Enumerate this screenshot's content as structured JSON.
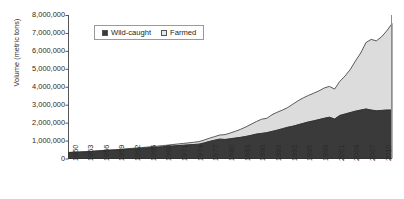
{
  "chart_data": {
    "type": "area",
    "title": "",
    "subtitle": "",
    "xlabel": "",
    "ylabel": "Volume (metric tons)",
    "stacked": true,
    "grid": false,
    "legend_position": "top-center",
    "xlim": [
      1950,
      2012
    ],
    "ylim": [
      0,
      8000000
    ],
    "y_ticks": [
      0,
      1000000,
      2000000,
      3000000,
      4000000,
      5000000,
      6000000,
      7000000,
      8000000
    ],
    "y_tick_labels": [
      "0",
      "1,000,000",
      "2,000,000",
      "3,000,000",
      "4,000,000",
      "5,000,000",
      "6,000,000",
      "7,000,000",
      "8,000,000"
    ],
    "x_ticks": [
      1950,
      1953,
      1956,
      1959,
      1962,
      1965,
      1968,
      1971,
      1974,
      1977,
      1980,
      1983,
      1986,
      1989,
      1992,
      1995,
      1998,
      2001,
      2004,
      2007,
      2010
    ],
    "x_tick_labels": [
      "1950",
      "1953",
      "1956",
      "1959",
      "1962",
      "1965",
      "1968",
      "1971",
      "1974",
      "1977",
      "1980",
      "1983",
      "1986",
      "1989",
      "1992",
      "1995",
      "1998",
      "2001",
      "2004",
      "2007",
      "2010"
    ],
    "x": [
      1950,
      1951,
      1952,
      1953,
      1954,
      1955,
      1956,
      1957,
      1958,
      1959,
      1960,
      1961,
      1962,
      1963,
      1964,
      1965,
      1966,
      1967,
      1968,
      1969,
      1970,
      1971,
      1972,
      1973,
      1974,
      1975,
      1976,
      1977,
      1978,
      1979,
      1980,
      1981,
      1982,
      1983,
      1984,
      1985,
      1986,
      1987,
      1988,
      1989,
      1990,
      1991,
      1992,
      1993,
      1994,
      1995,
      1996,
      1997,
      1998,
      1999,
      2000,
      2001,
      2002,
      2003,
      2004,
      2005,
      2006,
      2007,
      2008,
      2009,
      2010,
      2011,
      2012
    ],
    "series": [
      {
        "name": "Wild-caught",
        "color": "#3a3a3a",
        "values": [
          330000,
          340000,
          350000,
          365000,
          380000,
          400000,
          420000,
          440000,
          455000,
          470000,
          490000,
          510000,
          530000,
          550000,
          570000,
          590000,
          610000,
          630000,
          655000,
          675000,
          700000,
          720000,
          740000,
          760000,
          780000,
          800000,
          870000,
          950000,
          1020000,
          1080000,
          1060000,
          1100000,
          1140000,
          1180000,
          1230000,
          1290000,
          1360000,
          1400000,
          1440000,
          1510000,
          1580000,
          1660000,
          1740000,
          1800000,
          1880000,
          1960000,
          2040000,
          2100000,
          2170000,
          2240000,
          2300000,
          2200000,
          2400000,
          2480000,
          2560000,
          2640000,
          2700000,
          2760000,
          2700000,
          2660000,
          2680000,
          2700000,
          2700000
        ]
      },
      {
        "name": "Farmed",
        "color": "#dcdcdc",
        "values": [
          10000,
          11000,
          12000,
          13000,
          14000,
          15000,
          17000,
          19000,
          21000,
          23000,
          26000,
          29000,
          32000,
          36000,
          40000,
          45000,
          50000,
          56000,
          63000,
          70000,
          80000,
          90000,
          100000,
          112000,
          125000,
          140000,
          160000,
          180000,
          200000,
          230000,
          270000,
          320000,
          380000,
          450000,
          530000,
          620000,
          700000,
          790000,
          800000,
          930000,
          1000000,
          1040000,
          1100000,
          1230000,
          1340000,
          1420000,
          1480000,
          1540000,
          1600000,
          1690000,
          1720000,
          1670000,
          1900000,
          2120000,
          2400000,
          2800000,
          3180000,
          3700000,
          3940000,
          3900000,
          4100000,
          4420000,
          4820000
        ]
      }
    ]
  },
  "legend": {
    "entries": [
      {
        "label": "Wild-caught",
        "color": "#3a3a3a"
      },
      {
        "label": "Farmed",
        "color": "#e8e8e8"
      }
    ]
  },
  "axes": {
    "y_title": "Volume (metric tons)"
  }
}
